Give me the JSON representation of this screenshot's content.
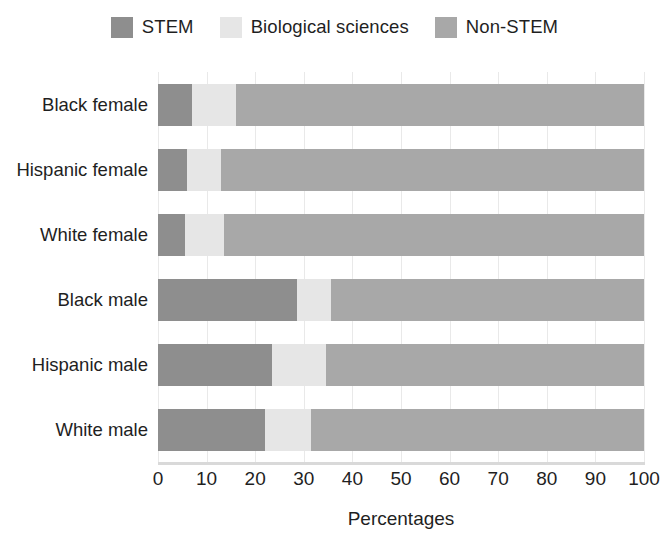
{
  "chart_data": {
    "type": "bar",
    "orientation": "horizontal",
    "stacked": true,
    "title": "",
    "xlabel": "Percentages",
    "ylabel": "",
    "xlim": [
      0,
      100
    ],
    "xticks": [
      0,
      10,
      20,
      30,
      40,
      50,
      60,
      70,
      80,
      90,
      100
    ],
    "grid": true,
    "legend_position": "top",
    "categories": [
      "Black female",
      "Hispanic female",
      "White female",
      "Black male",
      "Hispanic male",
      "White male"
    ],
    "series": [
      {
        "name": "STEM",
        "color": "#8e8e8e",
        "values": [
          7.0,
          6.0,
          5.5,
          28.5,
          23.5,
          22.0
        ]
      },
      {
        "name": "Biological sciences",
        "color": "#e6e6e6",
        "values": [
          9.0,
          7.0,
          8.0,
          7.0,
          11.0,
          9.5
        ]
      },
      {
        "name": "Non-STEM",
        "color": "#a8a8a8",
        "values": [
          84.0,
          87.0,
          86.5,
          64.5,
          65.5,
          68.5
        ]
      }
    ]
  },
  "legend": {
    "items": [
      {
        "label": "STEM",
        "color": "#8e8e8e"
      },
      {
        "label": "Biological sciences",
        "color": "#e6e6e6"
      },
      {
        "label": "Non-STEM",
        "color": "#a8a8a8"
      }
    ]
  },
  "axis": {
    "x_title": "Percentages",
    "x_ticks": [
      "0",
      "10",
      "20",
      "30",
      "40",
      "50",
      "60",
      "70",
      "80",
      "90",
      "100"
    ],
    "y_labels": [
      "Black female",
      "Hispanic female",
      "White female",
      "Black male",
      "Hispanic male",
      "White male"
    ]
  },
  "colors": {
    "stem": "#8e8e8e",
    "biological": "#e6e6e6",
    "non_stem": "#a8a8a8",
    "grid": "#e9e9e9",
    "axis": "#d9d9d9",
    "text": "#1f1f1f",
    "background": "#ffffff"
  }
}
